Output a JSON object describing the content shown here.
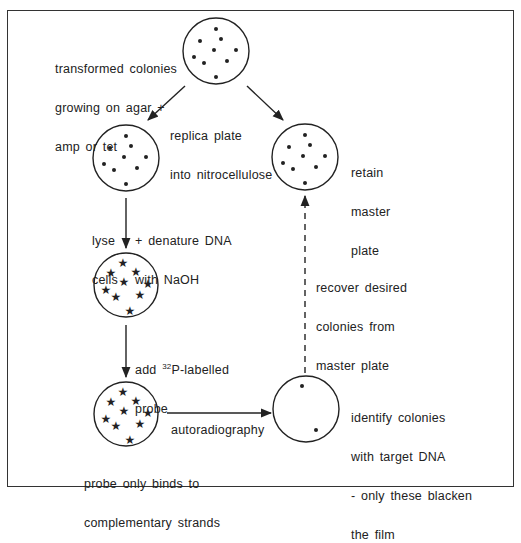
{
  "diagram": {
    "colors": {
      "stroke": "#222222",
      "background": "#ffffff",
      "frame": "#333333"
    },
    "nodes": [
      {
        "id": "start-plate",
        "cx": 216,
        "cy": 51,
        "r": 33,
        "marker": "dot",
        "label_lines": [
          "transformed colonies",
          "growing on agar +",
          "amp or tet"
        ]
      },
      {
        "id": "nitrocellulose-replica",
        "cx": 126,
        "cy": 158,
        "r": 33,
        "marker": "dot",
        "label_lines": []
      },
      {
        "id": "master-plate",
        "cx": 305,
        "cy": 157,
        "r": 33,
        "marker": "dot",
        "label_lines": [
          "retain",
          "master",
          "plate"
        ]
      },
      {
        "id": "denatured-filter",
        "cx": 126,
        "cy": 285,
        "r": 32,
        "marker": "star",
        "label_lines": []
      },
      {
        "id": "probed-filter",
        "cx": 126,
        "cy": 414,
        "r": 32,
        "marker": "star",
        "label_lines": [
          "probe only binds to",
          "complementary strands"
        ]
      },
      {
        "id": "autoradiograph",
        "cx": 306,
        "cy": 409,
        "r": 33,
        "marker": "dot",
        "label_lines": [
          "identify colonies",
          "with target DNA",
          "- only these blacken",
          "the film"
        ]
      }
    ],
    "edges": [
      {
        "from": "start-plate",
        "to": "nitrocellulose-replica",
        "style": "solid",
        "label_lines": [
          "replica plate",
          "into nitrocellulose"
        ]
      },
      {
        "from": "start-plate",
        "to": "master-plate",
        "style": "solid",
        "label_lines": []
      },
      {
        "from": "nitrocellulose-replica",
        "to": "denatured-filter",
        "style": "solid",
        "label_lines": [
          "lyse",
          "cells"
        ],
        "label2_lines": [
          "+ denature DNA",
          "with NaOH"
        ]
      },
      {
        "from": "denatured-filter",
        "to": "probed-filter",
        "style": "solid",
        "label_lines": [
          "add ",
          "probe"
        ],
        "label_sup": "32",
        "label_after_sup": "P-labelled"
      },
      {
        "from": "probed-filter",
        "to": "autoradiograph",
        "style": "solid",
        "label_lines": [
          "autoradiography"
        ]
      },
      {
        "from": "autoradiograph",
        "to": "master-plate",
        "style": "dashed",
        "label_lines": [
          "recover desired",
          "colonies from",
          "master plate"
        ]
      }
    ],
    "markers": {
      "dot_pattern": [
        [
          0,
          -22
        ],
        [
          -16,
          -10
        ],
        [
          5,
          -12
        ],
        [
          -2,
          -1
        ],
        [
          -22,
          6
        ],
        [
          20,
          -1
        ],
        [
          -12,
          12
        ],
        [
          11,
          10
        ],
        [
          0,
          26
        ]
      ],
      "star_pattern": [
        [
          -3,
          -22
        ],
        [
          -15,
          -12
        ],
        [
          10,
          -13
        ],
        [
          -2,
          -3
        ],
        [
          -20,
          5
        ],
        [
          22,
          -1
        ],
        [
          -10,
          12
        ],
        [
          14,
          10
        ],
        [
          4,
          26
        ]
      ],
      "autorad_dots": [
        [
          -4,
          -23
        ],
        [
          10,
          21
        ]
      ]
    }
  }
}
